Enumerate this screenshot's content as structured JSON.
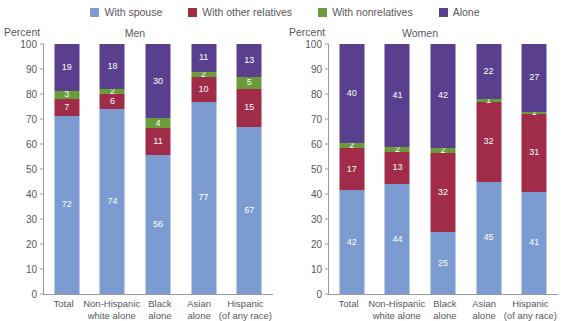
{
  "legend": {
    "items": [
      {
        "label": "With spouse",
        "color": "#7b9bd1",
        "key": "spouse"
      },
      {
        "label": "With other relatives",
        "color": "#a02c4a",
        "key": "other_relatives"
      },
      {
        "label": "With nonrelatives",
        "color": "#6b9c3a",
        "key": "nonrelatives"
      },
      {
        "label": "Alone",
        "color": "#5a3f8f",
        "key": "alone"
      }
    ]
  },
  "axis": {
    "ylabel": "Percent",
    "ticks": [
      "0",
      "10",
      "20",
      "30",
      "40",
      "50",
      "60",
      "70",
      "80",
      "90",
      "100"
    ]
  },
  "chart_data": {
    "type": "bar",
    "title": "",
    "xlabel": "",
    "ylabel": "Percent",
    "ylim": [
      0,
      100
    ],
    "grid": false,
    "legend_position": "top-center",
    "stacked": true,
    "categories": [
      [
        "Total"
      ],
      [
        "Non-Hispanic",
        "white alone"
      ],
      [
        "Black",
        "alone"
      ],
      [
        "Asian",
        "alone"
      ],
      [
        "Hispanic",
        "(of any race)"
      ]
    ],
    "panels": [
      {
        "title": "Men",
        "series": [
          {
            "name": "With spouse",
            "color": "#7b9bd1",
            "values": [
              72,
              74,
              56,
              77,
              67
            ]
          },
          {
            "name": "With other relatives",
            "color": "#a02c4a",
            "values": [
              7,
              6,
              11,
              10,
              15
            ]
          },
          {
            "name": "With nonrelatives",
            "color": "#6b9c3a",
            "values": [
              3,
              2,
              4,
              2,
              5
            ]
          },
          {
            "name": "Alone",
            "color": "#5a3f8f",
            "values": [
              19,
              18,
              30,
              11,
              13
            ]
          }
        ]
      },
      {
        "title": "Women",
        "series": [
          {
            "name": "With spouse",
            "color": "#7b9bd1",
            "values": [
              42,
              44,
              25,
              45,
              41
            ]
          },
          {
            "name": "With other relatives",
            "color": "#a02c4a",
            "values": [
              17,
              13,
              32,
              32,
              31
            ]
          },
          {
            "name": "With nonrelatives",
            "color": "#6b9c3a",
            "values": [
              2,
              2,
              2,
              1,
              1
            ]
          },
          {
            "name": "Alone",
            "color": "#5a3f8f",
            "values": [
              40,
              41,
              42,
              22,
              27
            ]
          }
        ]
      }
    ]
  }
}
